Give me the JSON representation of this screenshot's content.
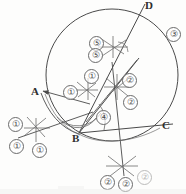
{
  "figure": {
    "style": {
      "ink": "#4a4a4a",
      "ink_dark": "#2e2e2e",
      "paper": "#fdfdfc",
      "mark": "#6b6b6b"
    },
    "circle": {
      "cx": 112,
      "cy": 75,
      "r": 66
    },
    "points": [
      {
        "name": "A",
        "label": "A",
        "x": 40,
        "y": 95,
        "lx": 33,
        "ly": 87
      },
      {
        "name": "B",
        "label": "B",
        "x": 79,
        "y": 133,
        "lx": 73,
        "ly": 134
      },
      {
        "name": "C",
        "label": "C",
        "x": 172,
        "y": 125,
        "lx": 163,
        "ly": 122
      },
      {
        "name": "D",
        "label": "D",
        "x": 142,
        "y": 14,
        "lx": 146,
        "ly": 1
      }
    ],
    "steps": [
      {
        "id": "s1a",
        "label": "①",
        "x": 8,
        "y": 117,
        "faint": false
      },
      {
        "id": "s1b",
        "label": "①",
        "x": 9,
        "y": 139,
        "faint": false
      },
      {
        "id": "s1c",
        "label": "①",
        "x": 32,
        "y": 143,
        "faint": false
      },
      {
        "id": "s1d",
        "label": "①",
        "x": 84,
        "y": 69,
        "faint": false
      },
      {
        "id": "s1e",
        "label": "①",
        "x": 63,
        "y": 85,
        "faint": false
      },
      {
        "id": "s2a",
        "label": "②",
        "x": 122,
        "y": 73,
        "faint": false
      },
      {
        "id": "s2b",
        "label": "②",
        "x": 123,
        "y": 95,
        "faint": false
      },
      {
        "id": "s2c",
        "label": "②",
        "x": 100,
        "y": 175,
        "faint": false
      },
      {
        "id": "s2d",
        "label": "②",
        "x": 118,
        "y": 177,
        "faint": false
      },
      {
        "id": "s2e",
        "label": "②",
        "x": 137,
        "y": 170,
        "faint": true
      },
      {
        "id": "s3",
        "label": "③",
        "x": 166,
        "y": 27,
        "faint": false
      },
      {
        "id": "s4",
        "label": "④",
        "x": 96,
        "y": 110,
        "faint": false
      },
      {
        "id": "s5a",
        "label": "⑤",
        "x": 89,
        "y": 36,
        "faint": false
      },
      {
        "id": "s5b",
        "label": "⑤",
        "x": 88,
        "y": 48,
        "faint": false
      }
    ]
  }
}
